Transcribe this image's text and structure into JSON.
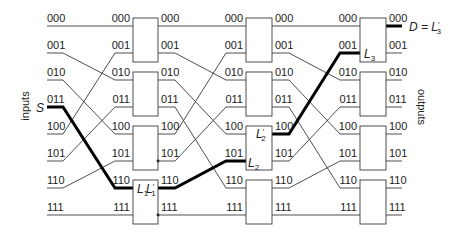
{
  "diagram": {
    "axis_labels": {
      "inputs": "inputs",
      "outputs": "outputs"
    },
    "row_labels": [
      "000",
      "001",
      "010",
      "011",
      "100",
      "101",
      "110",
      "111"
    ],
    "interconnect": {
      "pattern": "perfect-shuffle",
      "map": [
        0,
        2,
        4,
        6,
        1,
        3,
        5,
        7
      ]
    },
    "stages": [
      {
        "name": "stage-1",
        "boxes": 4
      },
      {
        "name": "stage-2",
        "boxes": 4
      },
      {
        "name": "stage-3",
        "boxes": 4
      }
    ],
    "highlight": {
      "input_row": 3,
      "stages": [
        {
          "in": 6,
          "out": 6
        },
        {
          "in": 5,
          "out": 4
        },
        {
          "in": 1,
          "out": 0
        }
      ]
    },
    "annotations": {
      "source": "S",
      "l1": {
        "base": "L",
        "sub": "1"
      },
      "l1_prime": {
        "base": "L",
        "prime": "′",
        "sub": "1"
      },
      "l2": {
        "base": "L",
        "sub": "2"
      },
      "l2_prime": {
        "base": "L",
        "prime": "′",
        "sub": "2"
      },
      "l3": {
        "base": "L",
        "sub": "3"
      },
      "destination": {
        "prefix": "D = ",
        "base": "L",
        "prime": "′",
        "sub": "3"
      }
    },
    "colors": {
      "wire": "#3a3a3a",
      "highlight": "#000000",
      "text": "#222222"
    }
  }
}
